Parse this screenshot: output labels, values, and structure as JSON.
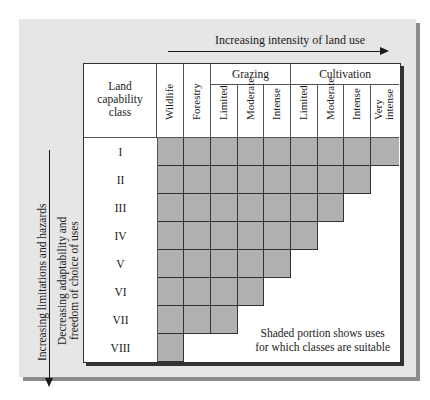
{
  "figure": {
    "top_axis_label": "Increasing intensity of land use",
    "left_axis_label_outer": "Increasing limitations and hazards",
    "left_axis_label_inner_line1": "Decreasing adaptability and",
    "left_axis_label_inner_line2": "freedom of choice of uses",
    "note_line1": "Shaded portion shows uses",
    "note_line2": "for which classes are suitable"
  },
  "table": {
    "corner_header_line1": "Land",
    "corner_header_line2": "capability",
    "corner_header_line3": "class",
    "groups": [
      {
        "label": "Grazing",
        "span": 3
      },
      {
        "label": "Cultivation",
        "span": 4
      }
    ],
    "columns": [
      "Wildlife",
      "Forestry",
      "Limited",
      "Moderate",
      "Intense",
      "Limited",
      "Moderate",
      "Intense",
      "Very intense"
    ],
    "column_very_line1": "Very",
    "column_very_line2": "intense",
    "rows": [
      {
        "class": "I",
        "suitable_count": 9
      },
      {
        "class": "II",
        "suitable_count": 8
      },
      {
        "class": "III",
        "suitable_count": 7
      },
      {
        "class": "IV",
        "suitable_count": 6
      },
      {
        "class": "V",
        "suitable_count": 5
      },
      {
        "class": "VI",
        "suitable_count": 4
      },
      {
        "class": "VII",
        "suitable_count": 3
      },
      {
        "class": "VIII",
        "suitable_count": 1
      }
    ]
  },
  "colors": {
    "panel_bg": "#e6e6e6",
    "shade": "#b0b0b0",
    "shadow": "#8c8c8c"
  }
}
